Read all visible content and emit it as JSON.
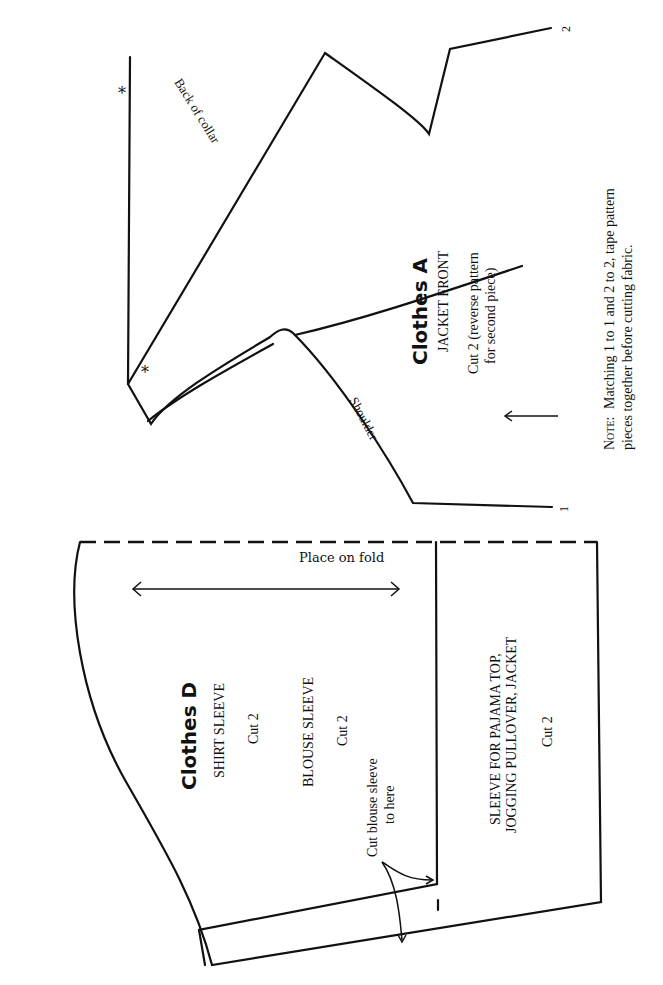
{
  "pieces": {
    "clothes_a": {
      "title": "Clothes A",
      "name": "JACKET FRONT",
      "cut_line1": "Cut 2 (reverse pattern",
      "cut_line2": "for second piece)",
      "back_of_collar": "Back of collar",
      "shoulder": "Shoulder",
      "asterisk": "*",
      "match_mark_1": "1",
      "match_mark_2": "2"
    },
    "clothes_d": {
      "title": "Clothes D",
      "shirt_sleeve": "SHIRT SLEEVE",
      "shirt_cut": "Cut 2",
      "blouse_sleeve": "BLOUSE SLEEVE",
      "blouse_cut": "Cut 2",
      "cut_blouse_line1": "Cut blouse sleeve",
      "cut_blouse_line2": "to here",
      "place_on_fold": "Place on fold",
      "sleeve_for_line1": "SLEEVE FOR PAJAMA TOP,",
      "sleeve_for_line2": "JOGGING PULLOVER, JACKET",
      "sleeve_for_cut": "Cut 2"
    }
  },
  "note": {
    "label": "Note:",
    "line1": "Matching 1 to 1 and 2 to 2, tape pattern",
    "line2": "pieces together before cutting fabric."
  }
}
